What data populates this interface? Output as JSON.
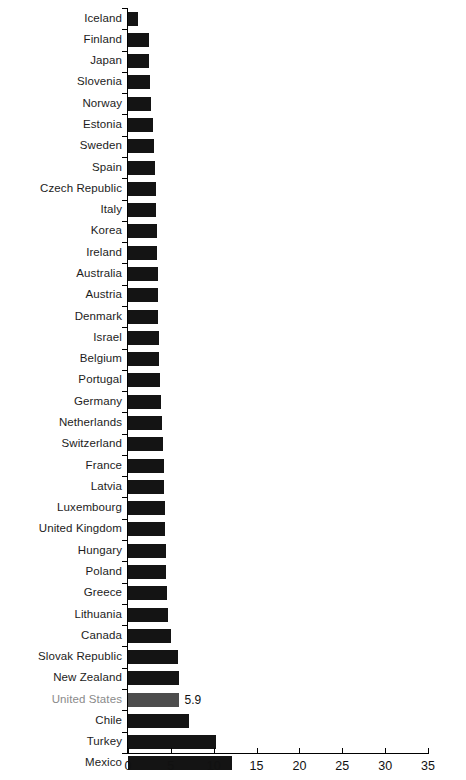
{
  "chart_data": {
    "type": "bar",
    "orientation": "horizontal",
    "title": "",
    "subtitle": "",
    "xlabel": "",
    "ylabel": "",
    "xlim": [
      0,
      35
    ],
    "xticks": [
      0,
      5,
      10,
      15,
      20,
      25,
      30,
      35
    ],
    "xtick_labels": [
      "0",
      "5",
      "10",
      "15",
      "20",
      "25",
      "30",
      "35"
    ],
    "grid": false,
    "legend": false,
    "bar_color": "#141414",
    "highlight_color": "#4d4d4d",
    "highlight_label_color": "#8a8a8a",
    "highlight_category": "United States",
    "categories": [
      "Iceland",
      "Finland",
      "Japan",
      "Slovenia",
      "Norway",
      "Estonia",
      "Sweden",
      "Spain",
      "Czech Republic",
      "Italy",
      "Korea",
      "Ireland",
      "Australia",
      "Austria",
      "Denmark",
      "Israel",
      "Belgium",
      "Portugal",
      "Germany",
      "Netherlands",
      "Switzerland",
      "France",
      "Latvia",
      "Luxembourg",
      "United Kingdom",
      "Hungary",
      "Poland",
      "Greece",
      "Lithuania",
      "Canada",
      "Slovak Republic",
      "New Zealand",
      "United States",
      "Chile",
      "Turkey",
      "Mexico"
    ],
    "values": [
      1.2,
      2.4,
      2.5,
      2.6,
      2.7,
      2.9,
      3.0,
      3.2,
      3.3,
      3.3,
      3.4,
      3.4,
      3.5,
      3.5,
      3.5,
      3.6,
      3.6,
      3.7,
      3.8,
      4.0,
      4.1,
      4.2,
      4.2,
      4.3,
      4.3,
      4.4,
      4.4,
      4.5,
      4.7,
      5.0,
      5.8,
      5.9,
      5.9,
      7.1,
      10.3,
      12.1
    ],
    "value_labels": [
      "",
      "",
      "",
      "",
      "",
      "",
      "",
      "",
      "",
      "",
      "",
      "",
      "",
      "",
      "",
      "",
      "",
      "",
      "",
      "",
      "",
      "",
      "",
      "",
      "",
      "",
      "",
      "",
      "",
      "",
      "",
      "",
      "5.9",
      "",
      "",
      ""
    ]
  }
}
